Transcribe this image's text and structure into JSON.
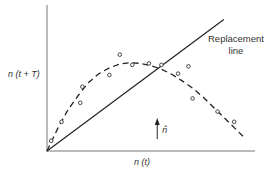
{
  "chart_data": {
    "type": "scatter",
    "title": "",
    "xlabel": "n (t)",
    "ylabel": "n (t + T)",
    "xlim": [
      0,
      1
    ],
    "ylim": [
      0,
      1
    ],
    "grid": false,
    "replacement_line": {
      "label_line1": "Replacement",
      "label_line2": "line",
      "from": [
        0,
        0
      ],
      "to": [
        0.85,
        0.9
      ]
    },
    "equilibrium_marker": {
      "label": "n̂",
      "x": 0.53
    },
    "points": [
      {
        "x": 0.02,
        "y": 0.07
      },
      {
        "x": 0.07,
        "y": 0.2
      },
      {
        "x": 0.16,
        "y": 0.33
      },
      {
        "x": 0.17,
        "y": 0.44
      },
      {
        "x": 0.3,
        "y": 0.52
      },
      {
        "x": 0.35,
        "y": 0.66
      },
      {
        "x": 0.41,
        "y": 0.59
      },
      {
        "x": 0.49,
        "y": 0.6
      },
      {
        "x": 0.55,
        "y": 0.59
      },
      {
        "x": 0.63,
        "y": 0.53
      },
      {
        "x": 0.68,
        "y": 0.58
      },
      {
        "x": 0.7,
        "y": 0.36
      },
      {
        "x": 0.82,
        "y": 0.27
      },
      {
        "x": 0.9,
        "y": 0.2
      }
    ],
    "fitted_curve": [
      [
        0.0,
        0.0
      ],
      [
        0.05,
        0.15
      ],
      [
        0.1,
        0.28
      ],
      [
        0.15,
        0.38
      ],
      [
        0.2,
        0.47
      ],
      [
        0.25,
        0.53
      ],
      [
        0.3,
        0.57
      ],
      [
        0.35,
        0.595
      ],
      [
        0.4,
        0.605
      ],
      [
        0.45,
        0.6
      ],
      [
        0.5,
        0.585
      ],
      [
        0.55,
        0.56
      ],
      [
        0.6,
        0.525
      ],
      [
        0.65,
        0.48
      ],
      [
        0.7,
        0.43
      ],
      [
        0.75,
        0.37
      ],
      [
        0.8,
        0.3
      ],
      [
        0.85,
        0.23
      ],
      [
        0.9,
        0.16
      ],
      [
        0.95,
        0.09
      ]
    ]
  }
}
